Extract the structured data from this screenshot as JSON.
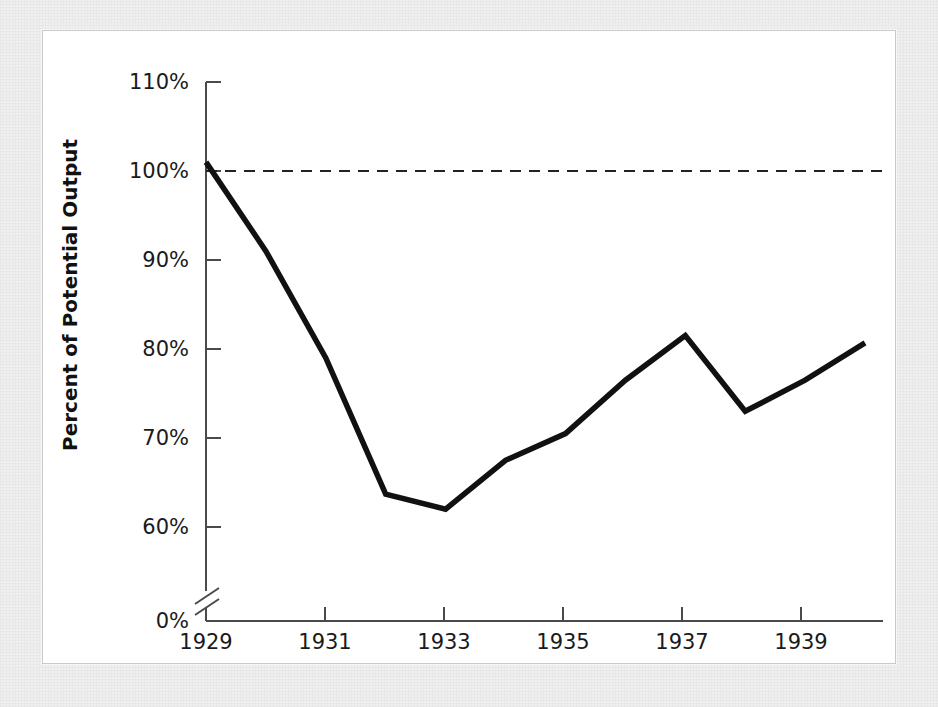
{
  "figure": {
    "panel_background": "#ffffff",
    "page_background": "#efefef",
    "line_color": "#111111",
    "axis_color": "#4a4a4a"
  },
  "axes": {
    "y_title": "Percent of Potential Output",
    "y_ticks": [
      "0%",
      "60%",
      "70%",
      "80%",
      "90%",
      "100%",
      "110%"
    ],
    "x_ticks": [
      "1929",
      "1931",
      "1933",
      "1935",
      "1937",
      "1939"
    ],
    "axis_break_label": "axis-break-0-to-60"
  },
  "chart_data": {
    "type": "line",
    "title": "",
    "xlabel": "",
    "ylabel": "Percent of Potential Output",
    "x": [
      1929,
      1930,
      1931,
      1932,
      1933,
      1934,
      1935,
      1936,
      1937,
      1938,
      1939,
      1940
    ],
    "values": [
      101.0,
      91.0,
      79.0,
      63.7,
      62.0,
      67.5,
      70.5,
      76.5,
      81.5,
      73.0,
      76.5,
      80.7
    ],
    "series": [
      {
        "name": "Actual output as percent of potential",
        "values": [
          101.0,
          91.0,
          79.0,
          63.7,
          62.0,
          67.5,
          70.5,
          76.5,
          81.5,
          73.0,
          76.5,
          80.7
        ]
      }
    ],
    "reference_line": {
      "label": "100% of potential output",
      "value": 100,
      "style": "dashed"
    },
    "xlim": [
      1929,
      1940
    ],
    "ylim": [
      60,
      110
    ],
    "y_axis_break": [
      0,
      60
    ],
    "y_tick_values": [
      0,
      60,
      70,
      80,
      90,
      100,
      110
    ],
    "x_tick_values": [
      1929,
      1931,
      1933,
      1935,
      1937,
      1939
    ],
    "grid": false,
    "legend": "none"
  }
}
